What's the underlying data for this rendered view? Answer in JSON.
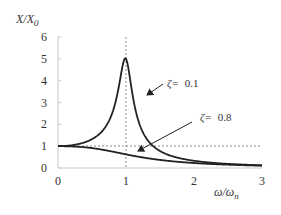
{
  "chart_data": {
    "type": "line",
    "title": "",
    "xlabel": "ω/ωn",
    "ylabel": "X/X0",
    "xlabel_parts": {
      "main": "ω/ω",
      "sub": "n"
    },
    "ylabel_parts": {
      "main": "X/X",
      "sub": "0"
    },
    "xlim": [
      0,
      3
    ],
    "ylim": [
      0,
      6
    ],
    "xticks": [
      "0",
      "1",
      "2",
      "3"
    ],
    "yticks": [
      "0",
      "1",
      "2",
      "3",
      "4",
      "5",
      "6"
    ],
    "grid": false,
    "legend": "none (inline arrow annotations)",
    "formula": "X/X0 = 1 / sqrt((1 - r^2)^2 + (2*zeta*r)^2)",
    "series": [
      {
        "name": "ζ= 0.1",
        "zeta": 0.1,
        "x": [
          0,
          0.25,
          0.5,
          0.75,
          0.9,
          1.0,
          1.1,
          1.25,
          1.5,
          2.0,
          2.5,
          3.0
        ],
        "values": [
          1.0,
          1.07,
          1.32,
          2.2,
          3.7,
          5.0,
          3.3,
          1.7,
          0.79,
          0.33,
          0.19,
          0.125
        ]
      },
      {
        "name": "ζ= 0.8",
        "zeta": 0.8,
        "x": [
          0,
          0.25,
          0.5,
          0.75,
          1.0,
          1.25,
          1.5,
          2.0,
          2.5,
          3.0
        ],
        "values": [
          1.0,
          0.99,
          0.93,
          0.77,
          0.63,
          0.48,
          0.37,
          0.23,
          0.15,
          0.11
        ]
      }
    ],
    "reference_lines": [
      {
        "orientation": "vertical",
        "x": 1,
        "style": "dotted"
      },
      {
        "orientation": "horizontal",
        "y": 1,
        "style": "dashed"
      }
    ],
    "annotations": [
      {
        "greek": "ζ=",
        "value": "0.1",
        "target_series": "ζ= 0.1"
      },
      {
        "greek": "ζ=",
        "value": "0.8",
        "target_series": "ζ= 0.8"
      }
    ]
  }
}
